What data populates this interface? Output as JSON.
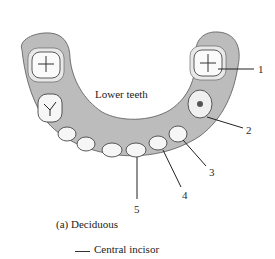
{
  "diagram": {
    "title": "Lower teeth",
    "caption": "(a) Deciduous",
    "colors": {
      "gum": "#b9b9b9",
      "gum_dark": "#8c8c8c",
      "tooth": "#f4f4f4",
      "outline": "#333333"
    },
    "labels": [
      {
        "number": "1"
      },
      {
        "number": "2"
      },
      {
        "number": "3"
      },
      {
        "number": "4"
      },
      {
        "number": "5"
      }
    ]
  },
  "answer": {
    "blank": "",
    "text": "Central incisor"
  }
}
